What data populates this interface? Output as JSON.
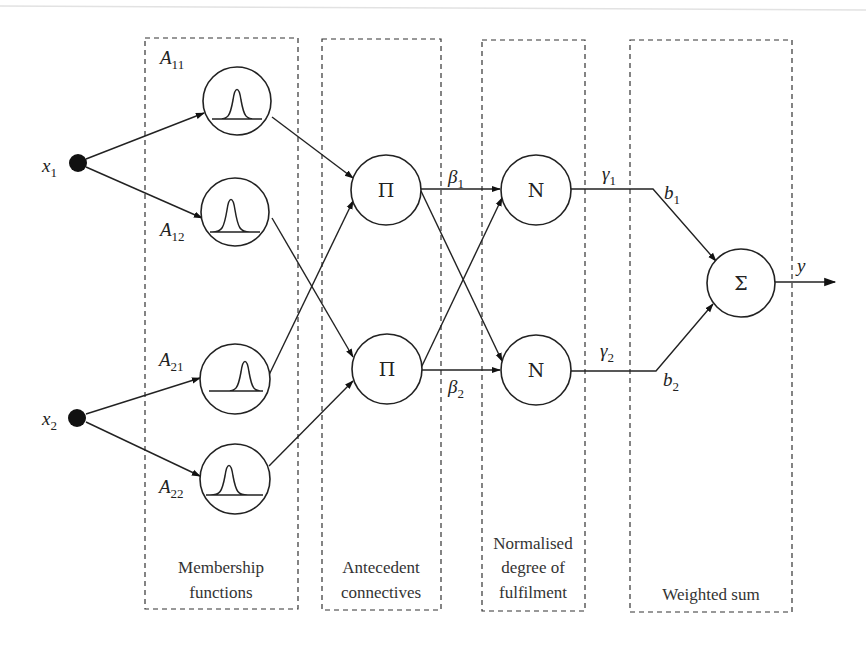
{
  "diagram": {
    "layers": [
      {
        "id": "membership",
        "caption_lines": [
          "Membership",
          "functions"
        ]
      },
      {
        "id": "antecedent",
        "caption_lines": [
          "Antecedent",
          "connectives"
        ]
      },
      {
        "id": "normalised",
        "caption_lines": [
          "Normalised",
          "degree of",
          "fulfilment"
        ]
      },
      {
        "id": "weighted",
        "caption_lines": [
          "Weighted sum"
        ]
      }
    ],
    "inputs": [
      {
        "id": "x1",
        "base": "x",
        "sub": "1"
      },
      {
        "id": "x2",
        "base": "x",
        "sub": "2"
      }
    ],
    "membership_functions": [
      {
        "id": "A11",
        "base": "A",
        "sub": "11"
      },
      {
        "id": "A12",
        "base": "A",
        "sub": "12"
      },
      {
        "id": "A21",
        "base": "A",
        "sub": "21"
      },
      {
        "id": "A22",
        "base": "A",
        "sub": "22"
      }
    ],
    "product_nodes": [
      {
        "id": "P1",
        "symbol": "Π"
      },
      {
        "id": "P2",
        "symbol": "Π"
      }
    ],
    "normalise_nodes": [
      {
        "id": "N1",
        "symbol": "N"
      },
      {
        "id": "N2",
        "symbol": "N"
      }
    ],
    "sum_node": {
      "id": "S",
      "symbol": "Σ"
    },
    "edge_labels": {
      "beta1": {
        "base": "β",
        "sub": "1"
      },
      "beta2": {
        "base": "β",
        "sub": "2"
      },
      "gamma1": {
        "base": "γ",
        "sub": "1"
      },
      "gamma2": {
        "base": "γ",
        "sub": "2"
      },
      "b1": {
        "base": "b",
        "sub": "1"
      },
      "b2": {
        "base": "b",
        "sub": "2"
      },
      "output": {
        "base": "y"
      }
    },
    "edges": [
      [
        "x1",
        "A11"
      ],
      [
        "x1",
        "A12"
      ],
      [
        "x2",
        "A21"
      ],
      [
        "x2",
        "A22"
      ],
      [
        "A11",
        "P1"
      ],
      [
        "A21",
        "P1"
      ],
      [
        "A12",
        "P2"
      ],
      [
        "A22",
        "P2"
      ],
      [
        "P1",
        "N1"
      ],
      [
        "P1",
        "N2"
      ],
      [
        "P2",
        "N1"
      ],
      [
        "P2",
        "N2"
      ],
      [
        "N1",
        "S"
      ],
      [
        "N2",
        "S"
      ],
      [
        "S",
        "y"
      ]
    ]
  }
}
